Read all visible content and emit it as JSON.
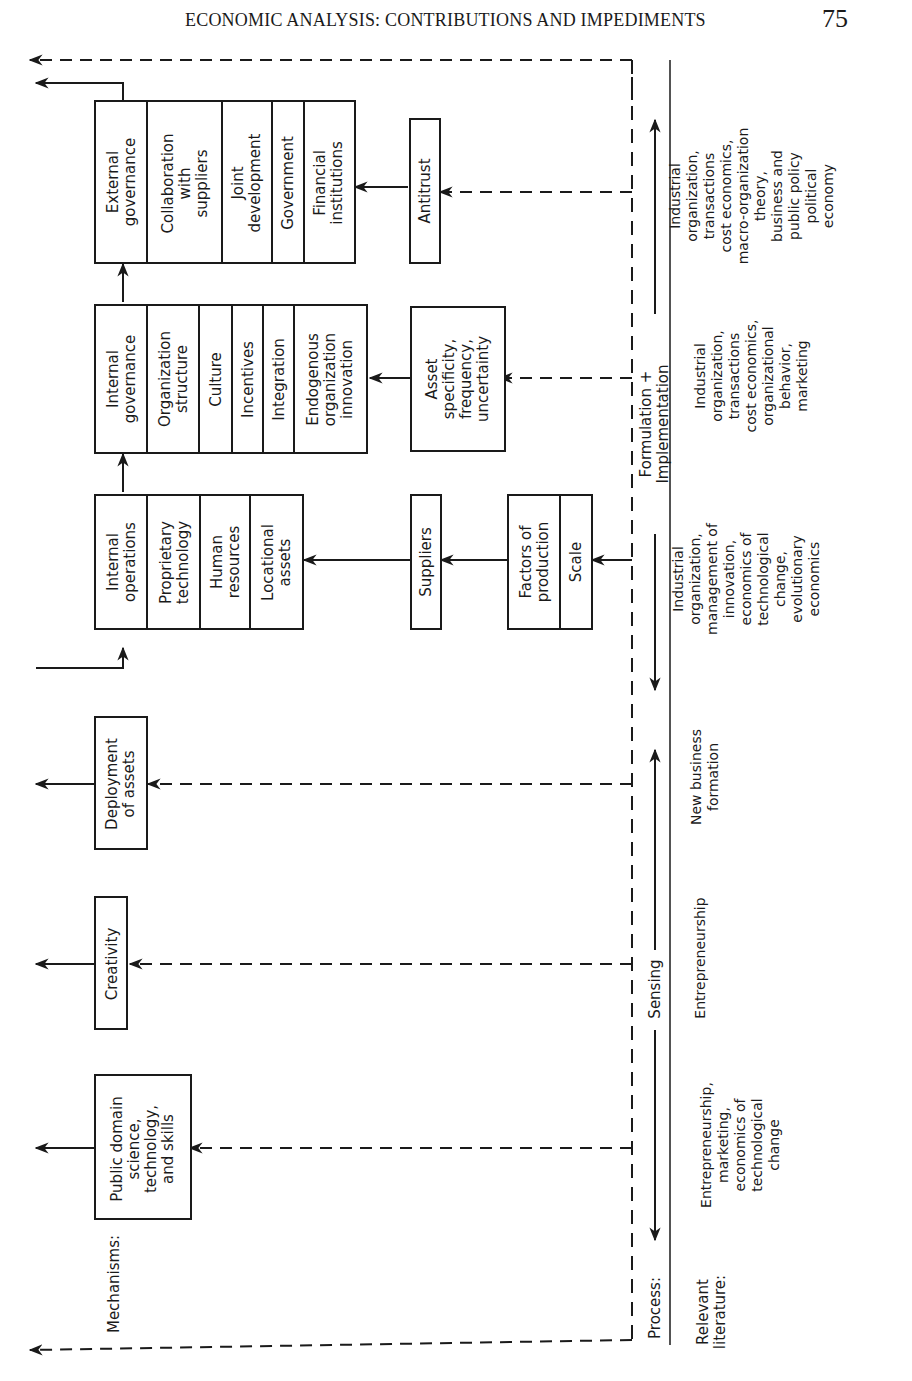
{
  "header": {
    "running_title": "ECONOMIC ANALYSIS: CONTRIBUTIONS AND IMPEDIMENTS",
    "page_number": "75"
  },
  "row_labels": {
    "mechanisms": "Mechanisms:",
    "process": "Process:",
    "relevant_literature": "Relevant\nliterature:"
  },
  "mechanisms": {
    "external_governance": {
      "header": "External\ngovernance",
      "items": [
        "Collaboration\nwith\nsuppliers",
        "Joint\ndevelopment",
        "Government",
        "Financial\ninstitutions"
      ]
    },
    "antitrust": "Antitrust",
    "internal_governance": {
      "header": "Internal\ngovernance",
      "items": [
        "Organization\nstructure",
        "Culture",
        "Incentives",
        "Integration",
        "Endogenous\norganization\ninnovation"
      ]
    },
    "asset_specificity": "Asset\nspecificity,\nfrequency,\nuncertainty",
    "internal_operations": {
      "header": "Internal\noperations",
      "items": [
        "Proprietary\ntechnology",
        "Human\nresources",
        "Locational\nassets"
      ]
    },
    "suppliers": "Suppliers",
    "factors": {
      "items": [
        "Factors of\nproduction",
        "Scale"
      ]
    },
    "deployment_of_assets": "Deployment\nof assets",
    "creativity": "Creativity",
    "public_domain": "Public domain\nscience,\ntechnology,\nand skills"
  },
  "process": {
    "formulation_implementation": "Formulation + Implementation",
    "sensing": "Sensing"
  },
  "literature": {
    "external_governance": "Industrial\norganization,\ntransactions\ncost economics,\nmacro-organization\ntheory,\nbusiness and\npublic policy\npolitical\neconomy",
    "internal_governance": "Industrial\norganization,\ntransactions\ncost economics,\norganizational\nbehavior,\nmarketing",
    "internal_operations": "Industrial\norganization,\nmanagement of\ninnovation,\neconomics of\ntechnological\nchange,\nevolutionary\neconomics",
    "deployment": "New business\nformation",
    "creativity": "Entrepreneurship",
    "public_domain": "Entrepreneurship,\nmarketing,\neconomics of\ntechnological\nchange"
  }
}
